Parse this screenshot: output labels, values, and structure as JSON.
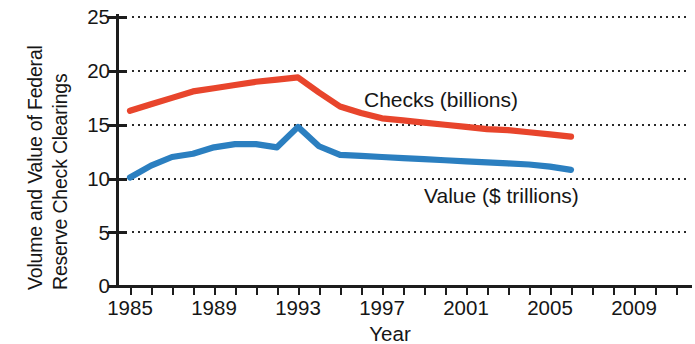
{
  "chart_data": {
    "type": "line",
    "title": "",
    "xlabel": "Year",
    "ylabel": "Volume and Value of Federal Reserve Check Clearings",
    "ylabel_lines": [
      "Volume and Value of Federal",
      "Reserve Check Clearings"
    ],
    "xlim": [
      1985,
      2011
    ],
    "ylim": [
      0,
      25
    ],
    "yticks": [
      0,
      5,
      10,
      15,
      20,
      25
    ],
    "ytick_labels": [
      "0",
      "5",
      "10",
      "15",
      "20",
      "25"
    ],
    "xticks": [
      1985,
      1986,
      1987,
      1988,
      1989,
      1990,
      1991,
      1992,
      1993,
      1994,
      1995,
      1996,
      1997,
      1998,
      1999,
      2000,
      2001,
      2002,
      2003,
      2004,
      2005,
      2006,
      2007,
      2008,
      2009,
      2010,
      2011
    ],
    "xtick_labels_shown": [
      "1985",
      "1989",
      "1993",
      "1997",
      "2001",
      "2005",
      "2009"
    ],
    "grid": "horizontal-dotted",
    "legend_position": "inline-annotations",
    "series": [
      {
        "name": "Checks (billions)",
        "color": "#e8452c",
        "x": [
          1985,
          1986,
          1987,
          1988,
          1989,
          1990,
          1991,
          1992,
          1993,
          1994,
          1995,
          1996,
          1997,
          1998,
          1999,
          2000,
          2001,
          2002,
          2003,
          2004,
          2005,
          2006
        ],
        "values": [
          16.3,
          16.9,
          17.5,
          18.1,
          18.4,
          18.7,
          19.0,
          19.2,
          19.4,
          18.0,
          16.7,
          16.1,
          15.6,
          15.4,
          15.2,
          15.0,
          14.8,
          14.6,
          14.5,
          14.3,
          14.1,
          13.9
        ]
      },
      {
        "name": "Value ($ trillions)",
        "color": "#2b7fc0",
        "x": [
          1985,
          1986,
          1987,
          1988,
          1989,
          1990,
          1991,
          1992,
          1993,
          1994,
          1995,
          1996,
          1997,
          1998,
          1999,
          2000,
          2001,
          2002,
          2003,
          2004,
          2005,
          2006
        ],
        "values": [
          10.1,
          11.2,
          12.0,
          12.3,
          12.9,
          13.2,
          13.2,
          12.9,
          14.8,
          13.0,
          12.2,
          12.1,
          12.0,
          11.9,
          11.8,
          11.7,
          11.6,
          11.5,
          11.4,
          11.3,
          11.1,
          10.8
        ]
      }
    ],
    "annotations": [
      {
        "text": "Checks (billions)",
        "x": 1996,
        "y": 17.0
      },
      {
        "text": "Value ($ trillions)",
        "x": 1999,
        "y": 8.6
      }
    ]
  },
  "axes_geometry": {
    "plot_left_px": 117,
    "plot_right_px": 692,
    "plot_top_px": 15,
    "plot_bottom_px": 286,
    "x_first_tick_px": 130,
    "x_px_per_year": 21.0,
    "y_zero_px": 286,
    "y_px_per_unit": 10.75
  },
  "colors": {
    "checks": "#e8452c",
    "value": "#2b7fc0",
    "axis": "#1d1d1d",
    "grid": "#2a2a2a",
    "text": "#161616",
    "background": "#ffffff"
  }
}
